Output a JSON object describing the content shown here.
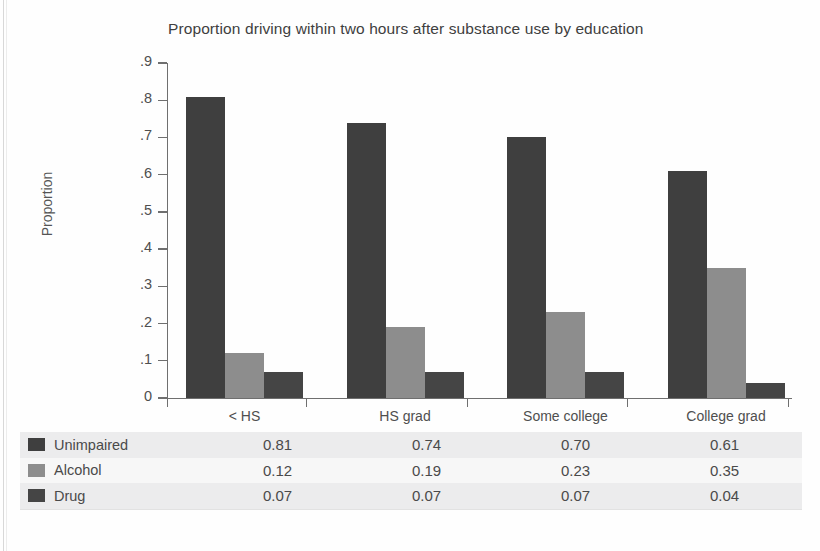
{
  "chart_data": {
    "type": "bar",
    "title": "Proportion driving within two hours after substance use by education",
    "xlabel": "",
    "ylabel": "Proportion",
    "categories": [
      "< HS",
      "HS grad",
      "Some college",
      "College grad"
    ],
    "series": [
      {
        "name": "Unimpaired",
        "values": [
          0.81,
          0.74,
          0.7,
          0.61
        ],
        "color": "#3f3f3f"
      },
      {
        "name": "Alcohol",
        "values": [
          0.12,
          0.19,
          0.23,
          0.35
        ],
        "color": "#8d8d8d"
      },
      {
        "name": "Drug",
        "values": [
          0.07,
          0.07,
          0.07,
          0.04
        ],
        "color": "#454545"
      }
    ],
    "ylim": [
      0,
      0.9
    ],
    "ytick_labels": [
      "0",
      ".1",
      ".2",
      ".3",
      ".4",
      ".5",
      ".6",
      ".7",
      ".8",
      ".9"
    ],
    "ytick_values": [
      0,
      0.1,
      0.2,
      0.3,
      0.4,
      0.5,
      0.6,
      0.7,
      0.8,
      0.9
    ],
    "grid": false,
    "legend_position": "bottom-table"
  },
  "table": {
    "column_headers": [
      "< HS",
      "HS grad",
      "Some college",
      "College grad"
    ],
    "rows": [
      {
        "label": "Unimpaired",
        "swatch": "#3f3f3f",
        "values": [
          "0.81",
          "0.74",
          "0.70",
          "0.61"
        ]
      },
      {
        "label": "Alcohol",
        "swatch": "#8d8d8d",
        "values": [
          "0.12",
          "0.19",
          "0.23",
          "0.35"
        ]
      },
      {
        "label": "Drug",
        "swatch": "#454545",
        "values": [
          "0.07",
          "0.07",
          "0.07",
          "0.04"
        ]
      }
    ]
  },
  "colors": {
    "unimpaired": "#3f3f3f",
    "alcohol": "#8d8d8d",
    "drug": "#454545",
    "axis": "#6f6f6f",
    "text": "#4a4a4a",
    "row_shaded": "#ececed",
    "row_plain": "#f7f7f7"
  }
}
